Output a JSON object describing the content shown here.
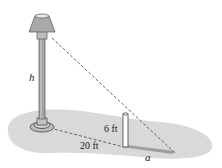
{
  "diagram": {
    "type": "similar-triangles-lamp-post",
    "labels": {
      "lamp_height": "h",
      "post_height": "6 ft",
      "distance": "20 ft",
      "shadow_length": "a"
    },
    "colors": {
      "ground": "#d9d9d9",
      "shadow": "#a6a6a6",
      "lamp_shade": "#a9a9a9",
      "pole": "#9a9a9a",
      "outline": "#555555",
      "dashed_line": "#555555",
      "post": "#ffffff"
    }
  }
}
